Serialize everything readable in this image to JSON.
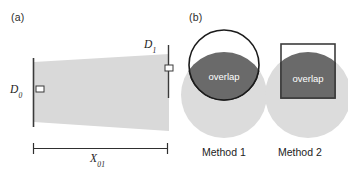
{
  "figure": {
    "panels": [
      {
        "id": "a",
        "label": "(a)",
        "description": "tapered beam / wedge cross-section with near and far apertures",
        "annotations": {
          "near_diameter_label": "D",
          "near_diameter_sub": "0",
          "far_diameter_label": "D",
          "far_diameter_sub": "1",
          "distance_label": "X",
          "distance_sub": "01"
        },
        "colors": {
          "wedge_fill": "#d9d9d9",
          "axis_line": "#3a3a3a",
          "marker_fill": "#ffffff"
        }
      },
      {
        "id": "b",
        "label": "(b)",
        "description": "two ways of computing the overlap between apertures",
        "methods": [
          {
            "caption": "Method 1",
            "overlap_label": "overlap",
            "shape": "circle-over-circle lens",
            "colors": {
              "base_circle": "#dcdcdc",
              "outline_circle_stroke": "#1c1c1c",
              "outline_circle_fill": "#ffffff",
              "overlap_fill": "#6a6a6a",
              "overlap_text": "#ffffff"
            }
          },
          {
            "caption": "Method 2",
            "overlap_label": "overlap",
            "shape": "square-over-circle",
            "colors": {
              "base_circle": "#dcdcdc",
              "outline_square_stroke": "#3c3c3c",
              "outline_square_fill": "#ffffff",
              "overlap_fill": "#6a6a6a",
              "overlap_text": "#ffffff"
            }
          }
        ]
      }
    ],
    "background": "#ffffff"
  }
}
